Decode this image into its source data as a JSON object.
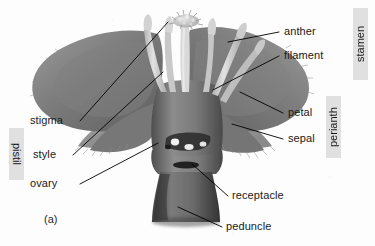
{
  "figure": {
    "caption": "(a)"
  },
  "labels": {
    "anther": "anther",
    "filament": "filament",
    "petal": "petal",
    "sepal": "sepal",
    "stigma": "stigma",
    "style": "style",
    "ovary": "ovary",
    "receptacle": "receptacle",
    "peduncle": "peduncle"
  },
  "group_labels": {
    "stamen": "stamen",
    "perianth": "perianth",
    "pistil": "pistil"
  },
  "colors": {
    "background": "#fdfdfd",
    "text": "#1a1a1a",
    "group_box": "#e0e0e0",
    "leader_line": "#000000",
    "petal_dark": "#6d6d6d",
    "petal_mid": "#858585",
    "sepal": "#9a9a9a",
    "filament_pale": "#cfcfcf",
    "stigma_pale": "#d8d8d8",
    "receptacle": "#7a7a7a",
    "peduncle": "#5e5e5e",
    "ovule": "#f0f0f0",
    "ovary_cavity": "#232323"
  }
}
